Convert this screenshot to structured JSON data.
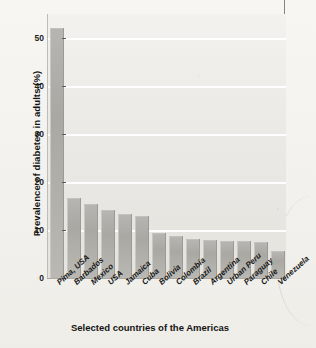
{
  "chart_data": {
    "type": "bar",
    "title": "",
    "xlabel": "Selected countries of the Americas",
    "ylabel": "Prevalence of diabetes in adults (%)",
    "ylim": [
      0,
      55
    ],
    "yticks": [
      0,
      10,
      20,
      30,
      40,
      50
    ],
    "grid": "horizontal",
    "legend": "none",
    "categories": [
      "Pima, USA",
      "Barbados",
      "Mexico",
      "USA",
      "Jamaica",
      "Cuba",
      "Bolivia",
      "Colombia",
      "Brazil",
      "Argentina",
      "Urban Peru",
      "Paraguay",
      "Chile",
      "Venezuela"
    ],
    "values": [
      51.8,
      16.5,
      15.2,
      14.0,
      13.2,
      12.8,
      9.2,
      8.6,
      8.0,
      7.8,
      7.6,
      7.4,
      7.2,
      5.4
    ],
    "series": [
      {
        "name": "Prevalence of diabetes in adults (%)",
        "values": [
          51.8,
          16.5,
          15.2,
          14.0,
          13.2,
          12.8,
          9.2,
          8.6,
          8.0,
          7.8,
          7.6,
          7.4,
          7.2,
          5.4
        ]
      }
    ]
  },
  "axis": {
    "y_tick_labels": [
      "50",
      "40",
      "30",
      "20",
      "10",
      "0"
    ],
    "y_title": "Prevalence of diabetes in adults (%)",
    "x_title": "Selected countries of the Americas"
  },
  "colors": {
    "bar_fill": "#adaca7",
    "plot_background": "#ecebe7",
    "gridline": "#ffffff",
    "text": "#171716"
  }
}
